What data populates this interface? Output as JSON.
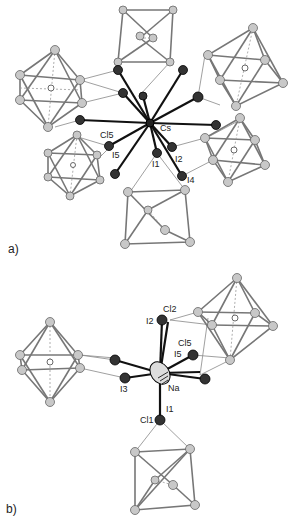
{
  "figure": {
    "panels": [
      {
        "id": "a",
        "label": "a)",
        "central_atom": "Cs",
        "atom_labels": {
          "cs": "Cs",
          "cl5": "Cl5",
          "i5": "I5",
          "i1": "I1",
          "i2": "I2",
          "i4": "I4"
        }
      },
      {
        "id": "b",
        "label": "b)",
        "central_atom": "Na",
        "atom_labels": {
          "na": "Na",
          "cl2": "Cl2",
          "i2": "I2",
          "cl5": "Cl5",
          "i5": "I5",
          "i3": "I3",
          "i1": "I1",
          "cl1": "Cl1"
        }
      }
    ]
  }
}
